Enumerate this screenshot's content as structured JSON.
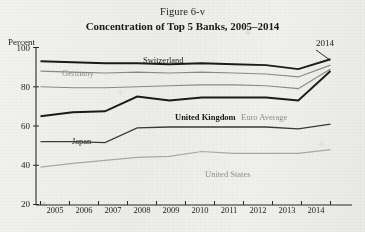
{
  "figure": {
    "caption": "Figure 6-v",
    "title": "Concentration of Top 5 Banks, 2005–2014"
  },
  "axes": {
    "y_unit_label": "Percent",
    "y_ticks": [
      "100",
      "80",
      "60",
      "40",
      "20"
    ],
    "x_ticks": [
      "2005",
      "2006",
      "2007",
      "2008",
      "2009",
      "2010",
      "2011",
      "2012",
      "2013",
      "2014"
    ]
  },
  "annotations": [
    {
      "text": "2014",
      "name": "annotation-2014"
    }
  ],
  "series_labels": {
    "switzerland": "Switzerland",
    "germany": "Germany",
    "euro_average": "Euro Average",
    "united_kingdom": "United Kingdom",
    "japan": "Japan",
    "united_states": "United States"
  },
  "colors": {
    "dark_line": "#1a1a1a",
    "gray_line": "#8a8a8a",
    "light_gray_line": "#a8a8a8",
    "axis": "#2a2a2a",
    "page_background": "#efefec"
  },
  "chart_data": {
    "type": "line",
    "title": "Concentration of Top 5 Banks, 2005–2014",
    "subtitle": "Figure 6-v",
    "xlabel": "",
    "ylabel": "Percent",
    "ylim": [
      20,
      100
    ],
    "ytick_step": 20,
    "grid": false,
    "legend": "inline-labels",
    "x": [
      2005,
      2006,
      2007,
      2008,
      2009,
      2010,
      2011,
      2012,
      2013,
      2014
    ],
    "series": [
      {
        "name": "Switzerland",
        "style": "bold-dark",
        "color": "#1a1a1a",
        "values": [
          93,
          92.5,
          92,
          92,
          91.5,
          92,
          91.5,
          91,
          89,
          94
        ]
      },
      {
        "name": "Germany",
        "style": "gray",
        "color": "#8a8a8a",
        "values": [
          88,
          87.5,
          87,
          87.5,
          87,
          87.5,
          87,
          86.5,
          85,
          91
        ]
      },
      {
        "name": "Euro Average",
        "style": "gray",
        "color": "#8a8a8a",
        "values": [
          80,
          79.5,
          79.5,
          80,
          80.5,
          81,
          81,
          80.5,
          79,
          89
        ]
      },
      {
        "name": "United Kingdom",
        "style": "bold-dark",
        "color": "#1a1a1a",
        "values": [
          65,
          67,
          67.5,
          75,
          73,
          74.5,
          74.5,
          74.5,
          73,
          88
        ]
      },
      {
        "name": "Japan",
        "style": "dark",
        "color": "#3a3a3a",
        "values": [
          52,
          52,
          51.5,
          59,
          59.5,
          59.5,
          59.5,
          59.5,
          58.5,
          61
        ]
      },
      {
        "name": "United States",
        "style": "light-gray",
        "color": "#a8a8a8",
        "values": [
          39,
          41,
          42.5,
          44,
          44.5,
          47,
          46,
          46,
          46,
          48
        ]
      }
    ]
  }
}
